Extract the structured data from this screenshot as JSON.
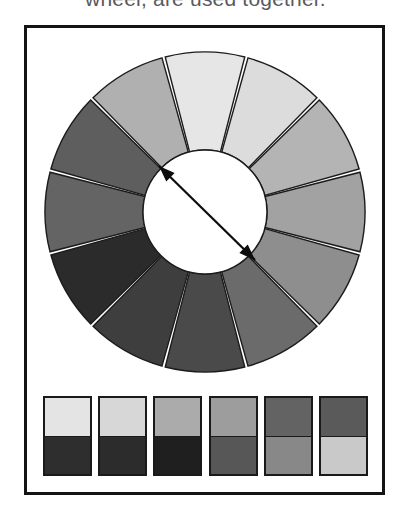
{
  "caption": {
    "text": "wheel, are used together."
  },
  "figure": {
    "frame_color": "#141414",
    "background_color": "#ffffff"
  },
  "color_wheel": {
    "name": "twelve-segment-grayscale-colour-wheel",
    "segment_count": 12,
    "outer_radius": 160,
    "inner_radius": 62,
    "center_x": 164,
    "center_y": 164,
    "gap_degrees": 1.2,
    "stroke_color": "#1c1c1c",
    "hub_color": "#ffffff",
    "segments": [
      {
        "index": 1,
        "position": "top",
        "start_deg": -105,
        "end_deg": -75,
        "fill": "#e6e6e6"
      },
      {
        "index": 2,
        "position": "top-right",
        "start_deg": -75,
        "end_deg": -45,
        "fill": "#dcdcdc"
      },
      {
        "index": 3,
        "position": "upper-right",
        "start_deg": -45,
        "end_deg": -15,
        "fill": "#b4b4b4"
      },
      {
        "index": 4,
        "position": "right",
        "start_deg": -15,
        "end_deg": 15,
        "fill": "#a2a2a2"
      },
      {
        "index": 5,
        "position": "lower-right",
        "start_deg": 15,
        "end_deg": 45,
        "fill": "#8e8e8e"
      },
      {
        "index": 6,
        "position": "bottom-right",
        "start_deg": 45,
        "end_deg": 75,
        "fill": "#6b6b6b"
      },
      {
        "index": 7,
        "position": "bottom",
        "start_deg": 75,
        "end_deg": 105,
        "fill": "#4a4a4a"
      },
      {
        "index": 8,
        "position": "bottom-left",
        "start_deg": 105,
        "end_deg": 135,
        "fill": "#3e3e3e"
      },
      {
        "index": 9,
        "position": "lower-left",
        "start_deg": 135,
        "end_deg": 165,
        "fill": "#2b2b2b"
      },
      {
        "index": 10,
        "position": "left",
        "start_deg": 165,
        "end_deg": 195,
        "fill": "#646464"
      },
      {
        "index": 11,
        "position": "upper-left",
        "start_deg": 195,
        "end_deg": 225,
        "fill": "#5e5e5e"
      },
      {
        "index": 12,
        "position": "top-left",
        "start_deg": 225,
        "end_deg": 255,
        "fill": "#b0b0b0"
      }
    ],
    "arrow": {
      "name": "complementary-axis-arrow",
      "type": "double-headed",
      "color": "#0d0d0d",
      "from_x": 118,
      "from_y": 118,
      "to_x": 214,
      "to_y": 212,
      "description": "double-headed diagonal arrow across the hub marking opposite (complementary) colours"
    }
  },
  "swatch_row": {
    "name": "complementary-pair-swatches",
    "count": 6,
    "pairs": [
      {
        "index": 1,
        "top": "#e4e4e4",
        "bottom": "#2e2e2e"
      },
      {
        "index": 2,
        "top": "#d7d7d7",
        "bottom": "#2c2c2c"
      },
      {
        "index": 3,
        "top": "#ababab",
        "bottom": "#1f1f1f"
      },
      {
        "index": 4,
        "top": "#9d9d9d",
        "bottom": "#575757"
      },
      {
        "index": 5,
        "top": "#636363",
        "bottom": "#888888"
      },
      {
        "index": 6,
        "top": "#5a5a5a",
        "bottom": "#c9c9c9"
      }
    ]
  }
}
